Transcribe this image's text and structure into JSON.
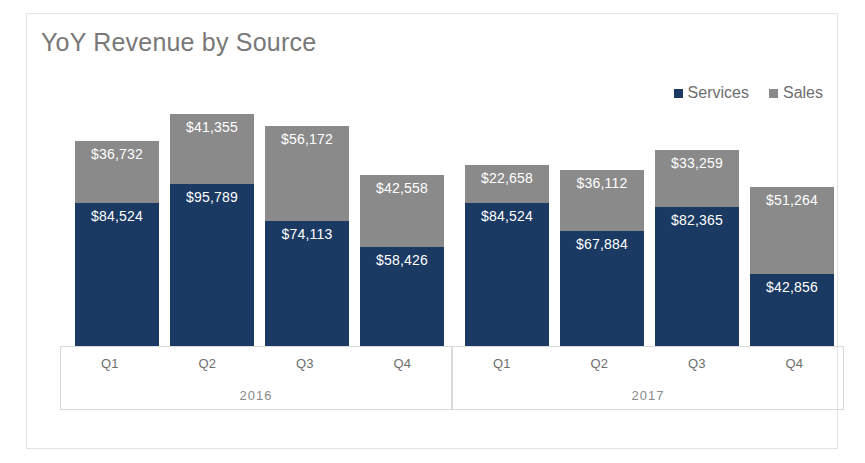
{
  "chart_data": {
    "type": "bar",
    "title": "YoY Revenue by Source",
    "stacked": true,
    "xlabel": "",
    "ylabel": "",
    "grid": false,
    "legend_position": "top-right",
    "axis_groups": [
      {
        "year": "2016",
        "categories": [
          "Q1",
          "Q2",
          "Q3",
          "Q4"
        ]
      },
      {
        "year": "2017",
        "categories": [
          "Q1",
          "Q2",
          "Q3",
          "Q4"
        ]
      }
    ],
    "categories": [
      "Q1",
      "Q2",
      "Q3",
      "Q4",
      "Q1",
      "Q2",
      "Q3",
      "Q4"
    ],
    "series": [
      {
        "name": "Services",
        "color": "#1a3a63",
        "values": [
          84524,
          95789,
          74113,
          58426,
          84524,
          67884,
          82365,
          42856
        ],
        "labels": [
          "$84,524",
          "$95,789",
          "$74,113",
          "$58,426",
          "$84,524",
          "$67,884",
          "$82,365",
          "$42,856"
        ]
      },
      {
        "name": "Sales",
        "color": "#8a8a8a",
        "values": [
          36732,
          41355,
          56172,
          42558,
          22658,
          36112,
          33259,
          51264
        ],
        "labels": [
          "$36,732",
          "$41,355",
          "$56,172",
          "$42,558",
          "$22,658",
          "$36,112",
          "$33,259",
          "$51,264"
        ]
      }
    ],
    "totals": [
      121256,
      137144,
      130285,
      100984,
      107182,
      103996,
      115624,
      94120
    ],
    "ylim": [
      0,
      137144
    ]
  },
  "legend": {
    "items": [
      {
        "label": "Services",
        "color": "#1a3a63"
      },
      {
        "label": "Sales",
        "color": "#8a8a8a"
      }
    ]
  }
}
